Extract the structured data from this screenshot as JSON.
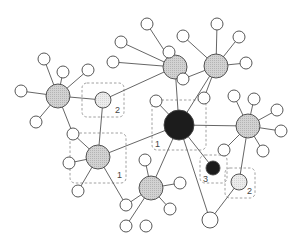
{
  "diagram": {
    "type": "network-graph",
    "colors": {
      "edge": "#555555",
      "leaf_fill": "#ffffff",
      "hub_fill": "#cfcfcf",
      "light_fill": "#e6e6e6",
      "dark_fill": "#1c1c1c",
      "cluster_border": "#888888"
    },
    "nodes": [
      {
        "id": "hubL",
        "kind": "hub",
        "x": 58,
        "y": 96,
        "r": 12
      },
      {
        "id": "hubT1",
        "kind": "hub",
        "x": 175,
        "y": 67,
        "r": 12
      },
      {
        "id": "hubT2",
        "kind": "hub",
        "x": 216,
        "y": 66,
        "r": 12
      },
      {
        "id": "hubR",
        "kind": "hub",
        "x": 248,
        "y": 126,
        "r": 12
      },
      {
        "id": "hubLL",
        "kind": "hub",
        "x": 98,
        "y": 157,
        "r": 12
      },
      {
        "id": "hubB",
        "kind": "hub",
        "x": 151,
        "y": 188,
        "r": 12
      },
      {
        "id": "center",
        "kind": "dark",
        "x": 179,
        "y": 125,
        "r": 15
      },
      {
        "id": "smallDark",
        "kind": "dark",
        "x": 213,
        "y": 168,
        "r": 7
      },
      {
        "id": "light1",
        "kind": "light",
        "x": 103,
        "y": 100,
        "r": 8
      },
      {
        "id": "light2",
        "kind": "light",
        "x": 239,
        "y": 182,
        "r": 8
      },
      {
        "id": "l1",
        "kind": "leaf",
        "x": 44,
        "y": 59,
        "r": 6
      },
      {
        "id": "l2",
        "kind": "leaf",
        "x": 63,
        "y": 72,
        "r": 6
      },
      {
        "id": "l3",
        "kind": "leaf",
        "x": 88,
        "y": 70,
        "r": 6
      },
      {
        "id": "l4",
        "kind": "leaf",
        "x": 21,
        "y": 91,
        "r": 6
      },
      {
        "id": "l5",
        "kind": "leaf",
        "x": 36,
        "y": 122,
        "r": 6
      },
      {
        "id": "l6",
        "kind": "leaf",
        "x": 121,
        "y": 42,
        "r": 6
      },
      {
        "id": "l7",
        "kind": "leaf",
        "x": 147,
        "y": 24,
        "r": 6
      },
      {
        "id": "l8",
        "kind": "leaf",
        "x": 113,
        "y": 62,
        "r": 6
      },
      {
        "id": "l9",
        "kind": "leaf",
        "x": 169,
        "y": 52,
        "r": 6
      },
      {
        "id": "l10",
        "kind": "leaf",
        "x": 183,
        "y": 36,
        "r": 6
      },
      {
        "id": "l11",
        "kind": "leaf",
        "x": 217,
        "y": 24,
        "r": 6
      },
      {
        "id": "l12",
        "kind": "leaf",
        "x": 239,
        "y": 37,
        "r": 6
      },
      {
        "id": "l13",
        "kind": "leaf",
        "x": 246,
        "y": 63,
        "r": 6
      },
      {
        "id": "l14",
        "kind": "leaf",
        "x": 183,
        "y": 79,
        "r": 6
      },
      {
        "id": "l15",
        "kind": "leaf",
        "x": 204,
        "y": 98,
        "r": 6
      },
      {
        "id": "l16",
        "kind": "leaf",
        "x": 234,
        "y": 96,
        "r": 6
      },
      {
        "id": "l17",
        "kind": "leaf",
        "x": 254,
        "y": 99,
        "r": 6
      },
      {
        "id": "l18",
        "kind": "leaf",
        "x": 277,
        "y": 110,
        "r": 6
      },
      {
        "id": "l19",
        "kind": "leaf",
        "x": 281,
        "y": 131,
        "r": 6
      },
      {
        "id": "l20",
        "kind": "leaf",
        "x": 263,
        "y": 151,
        "r": 6
      },
      {
        "id": "l21",
        "kind": "leaf",
        "x": 224,
        "y": 150,
        "r": 6
      },
      {
        "id": "l22",
        "kind": "leaf",
        "x": 156,
        "y": 101,
        "r": 6
      },
      {
        "id": "l23",
        "kind": "leaf",
        "x": 73,
        "y": 134,
        "r": 6
      },
      {
        "id": "l24",
        "kind": "leaf",
        "x": 69,
        "y": 163,
        "r": 6
      },
      {
        "id": "l25",
        "kind": "leaf",
        "x": 78,
        "y": 191,
        "r": 6
      },
      {
        "id": "l26",
        "kind": "leaf",
        "x": 126,
        "y": 205,
        "r": 6
      },
      {
        "id": "l27",
        "kind": "leaf",
        "x": 145,
        "y": 160,
        "r": 6
      },
      {
        "id": "l28",
        "kind": "leaf",
        "x": 180,
        "y": 183,
        "r": 6
      },
      {
        "id": "l29",
        "kind": "leaf",
        "x": 170,
        "y": 209,
        "r": 6
      },
      {
        "id": "l30",
        "kind": "leaf",
        "x": 126,
        "y": 226,
        "r": 6
      },
      {
        "id": "l31",
        "kind": "leaf",
        "x": 210,
        "y": 220,
        "r": 8
      },
      {
        "id": "l32",
        "kind": "leaf",
        "x": 146,
        "y": 226,
        "r": 6
      }
    ],
    "edges": [
      [
        "hubL",
        "l1"
      ],
      [
        "hubL",
        "l2"
      ],
      [
        "hubL",
        "l3"
      ],
      [
        "hubL",
        "l4"
      ],
      [
        "hubL",
        "l5"
      ],
      [
        "hubL",
        "light1"
      ],
      [
        "hubL",
        "l23"
      ],
      [
        "light1",
        "hubT1"
      ],
      [
        "light1",
        "hubLL"
      ],
      [
        "hubT1",
        "l6"
      ],
      [
        "hubT1",
        "l7"
      ],
      [
        "hubT1",
        "l8"
      ],
      [
        "hubT1",
        "l9"
      ],
      [
        "hubT1",
        "l14"
      ],
      [
        "hubT1",
        "center"
      ],
      [
        "l14",
        "hubT2"
      ],
      [
        "hubT2",
        "l10"
      ],
      [
        "hubT2",
        "l11"
      ],
      [
        "hubT2",
        "l12"
      ],
      [
        "hubT2",
        "l13"
      ],
      [
        "hubT2",
        "l15"
      ],
      [
        "hubT2",
        "center"
      ],
      [
        "center",
        "l22"
      ],
      [
        "center",
        "hubR"
      ],
      [
        "center",
        "hubLL"
      ],
      [
        "center",
        "hubB"
      ],
      [
        "center",
        "smallDark"
      ],
      [
        "center",
        "l31"
      ],
      [
        "hubR",
        "l16"
      ],
      [
        "hubR",
        "l17"
      ],
      [
        "hubR",
        "l18"
      ],
      [
        "hubR",
        "l19"
      ],
      [
        "hubR",
        "l20"
      ],
      [
        "hubR",
        "l21"
      ],
      [
        "hubR",
        "light2"
      ],
      [
        "light2",
        "l31"
      ],
      [
        "hubLL",
        "l23"
      ],
      [
        "hubLL",
        "l24"
      ],
      [
        "hubLL",
        "l25"
      ],
      [
        "hubLL",
        "l26"
      ],
      [
        "l26",
        "hubB"
      ],
      [
        "hubB",
        "l27"
      ],
      [
        "hubB",
        "l28"
      ],
      [
        "hubB",
        "l29"
      ],
      [
        "hubB",
        "l30"
      ]
    ],
    "clusters": [
      {
        "id": "c-light1",
        "label": "2",
        "x": 82,
        "y": 83,
        "w": 42,
        "h": 34,
        "label_x": 115,
        "label_y": 113
      },
      {
        "id": "c-hubLL",
        "label": "1",
        "x": 70,
        "y": 133,
        "w": 56,
        "h": 50,
        "label_x": 117,
        "label_y": 178
      },
      {
        "id": "c-center",
        "label": "1",
        "x": 152,
        "y": 100,
        "w": 54,
        "h": 50,
        "label_x": 155,
        "label_y": 147
      },
      {
        "id": "c-smallDark",
        "label": "3",
        "x": 200,
        "y": 155,
        "w": 27,
        "h": 28,
        "label_x": 203,
        "label_y": 182
      },
      {
        "id": "c-light2",
        "label": "2",
        "x": 225,
        "y": 168,
        "w": 30,
        "h": 30,
        "label_x": 247,
        "label_y": 194
      }
    ]
  }
}
